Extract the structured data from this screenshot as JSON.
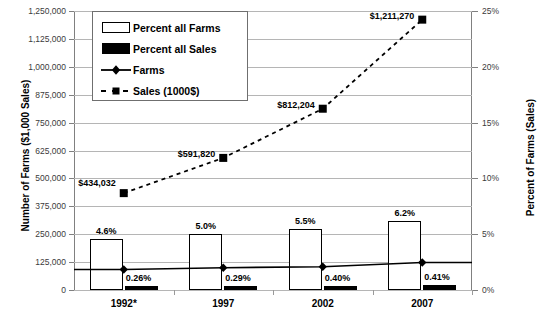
{
  "chart_data": {
    "type": "bar",
    "title": "",
    "xlabel": "",
    "ylabel": "Number of Farms ($1,000 Sales)",
    "y2label": "Percent of Farms (Sales)",
    "categories": [
      "1992*",
      "1997",
      "2002",
      "2007"
    ],
    "ylim": [
      0,
      1250000
    ],
    "y2lim": [
      0,
      25
    ],
    "grid": true,
    "legend_position": "upper-left-inside",
    "left_ticks": [
      "0",
      "125,000",
      "250,000",
      "375,000",
      "500,000",
      "625,000",
      "750,000",
      "875,000",
      "1,000,000",
      "1,125,000",
      "1,250,000"
    ],
    "left_tick_values": [
      0,
      125000,
      250000,
      375000,
      500000,
      625000,
      750000,
      875000,
      1000000,
      1125000,
      1250000
    ],
    "right_ticks": [
      "0%",
      "5%",
      "10%",
      "15%",
      "20%",
      "25%"
    ],
    "right_tick_values": [
      0,
      5,
      10,
      15,
      20,
      25
    ],
    "series": [
      {
        "name": "Percent all Farms",
        "type": "bar",
        "axis": "right",
        "unit": "%",
        "style": "open-bar",
        "values": [
          4.6,
          5.0,
          5.5,
          6.2
        ],
        "labels": [
          "4.6%",
          "5.0%",
          "5.5%",
          "6.2%"
        ]
      },
      {
        "name": "Percent all Sales",
        "type": "bar",
        "axis": "right",
        "unit": "%",
        "style": "solid-bar",
        "values": [
          0.26,
          0.29,
          0.4,
          0.41
        ],
        "labels": [
          "0.26%",
          "0.29%",
          "0.40%",
          "0.41%"
        ]
      },
      {
        "name": "Farms",
        "type": "line",
        "axis": "left",
        "style": "solid-line-diamond",
        "values": [
          92000,
          100000,
          104000,
          123000
        ],
        "labels": [
          "",
          "",
          "",
          ""
        ]
      },
      {
        "name": "Sales (1000$)",
        "type": "line",
        "axis": "left",
        "style": "dashed-line-square",
        "values": [
          434032,
          591820,
          812204,
          1211270
        ],
        "labels": [
          "$434,032",
          "$591,820",
          "$812,204",
          "$1,211,270"
        ]
      }
    ]
  },
  "legend": {
    "items": [
      {
        "label": "Percent all Farms",
        "key": "open-bar-icon"
      },
      {
        "label": "Percent all Sales",
        "key": "solid-bar-icon"
      },
      {
        "label": "Farms",
        "key": "line-diamond-icon"
      },
      {
        "label": "Sales (1000$)",
        "key": "dashed-square-icon"
      }
    ]
  }
}
